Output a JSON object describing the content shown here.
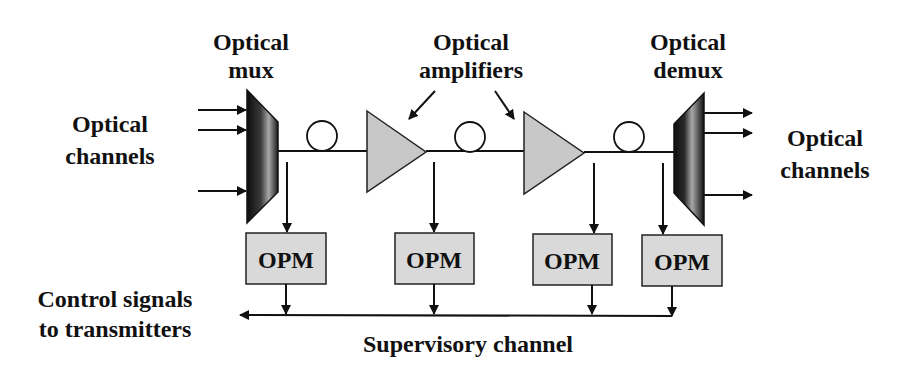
{
  "diagram": {
    "colors": {
      "line": "#111111",
      "amplifier_fill": "#c8c8c8",
      "opm_fill": "#d9d9d9",
      "mux_dark": "#111111",
      "mux_light": "#a0a0a0",
      "background": "#ffffff"
    },
    "labels": {
      "mux": [
        "Optical",
        "mux"
      ],
      "amplifiers": [
        "Optical",
        "amplifiers"
      ],
      "demux": [
        "Optical",
        "demux"
      ],
      "input_channels": [
        "Optical",
        "channels"
      ],
      "output_channels": [
        "Optical",
        "channels"
      ],
      "control_signals": [
        "Control signals",
        "to transmitters"
      ],
      "supervisory": "Supervisory channel"
    },
    "opm_modules": [
      {
        "label": "OPM"
      },
      {
        "label": "OPM"
      },
      {
        "label": "OPM"
      },
      {
        "label": "OPM"
      }
    ],
    "components": {
      "mux_inputs": 3,
      "demux_outputs": 3,
      "fiber_spools": 3,
      "amplifiers": 2,
      "opm_count": 4
    }
  }
}
